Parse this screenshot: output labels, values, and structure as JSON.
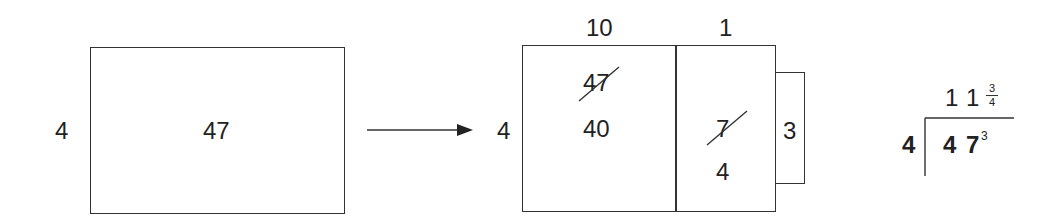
{
  "left_model": {
    "side_label": "4",
    "area_label": "47"
  },
  "arrow": {
    "direction": "right"
  },
  "area_model": {
    "side_label": "4",
    "column_headers": [
      "10",
      "1"
    ],
    "tens_region": {
      "crossed_value": "47",
      "value": "40"
    },
    "ones_region": {
      "crossed_value": "7",
      "value": "4"
    },
    "remainder_label": "3"
  },
  "long_division": {
    "divisor": "4",
    "dividend_digits": [
      "4",
      "7"
    ],
    "remainder_superscript": "3",
    "quotient_digits": [
      "1",
      "1"
    ],
    "quotient_fraction": {
      "numerator": "3",
      "denominator": "4"
    }
  }
}
